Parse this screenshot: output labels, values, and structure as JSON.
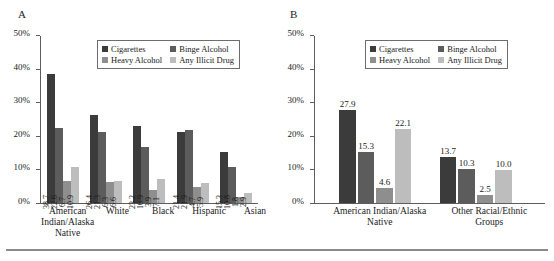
{
  "figure": {
    "panels": [
      {
        "letter": "A",
        "name": "panel-a",
        "axis": {
          "ylabel": "",
          "xlabel": "",
          "ticks": [
            "0%",
            "10%",
            "20%",
            "30%",
            "40%",
            "50%"
          ],
          "ymin": 0,
          "ymax": 50
        },
        "legend": [
          {
            "label": "Cigarettes",
            "color": "#3b3b3b"
          },
          {
            "label": "Binge Alcohol",
            "color": "#5c5c5c"
          },
          {
            "label": "Heavy Alcohol",
            "color": "#8e8e8e"
          },
          {
            "label": "Any Illicit Drug",
            "color": "#bdbdbd"
          }
        ],
        "groups": [
          {
            "label": "American Indian/Alaska Native",
            "bars": [
              {
                "series": "Cigarettes",
                "value": 38.7,
                "label": "38.7"
              },
              {
                "series": "Binge Alcohol",
                "value": 22.6,
                "label": "22.6"
              },
              {
                "series": "Heavy Alcohol",
                "value": 6.7,
                "label": "6.7"
              },
              {
                "series": "Any Illicit Drug",
                "value": 10.9,
                "label": "10.9"
              }
            ]
          },
          {
            "label": "White",
            "bars": [
              {
                "series": "Cigarettes",
                "value": 26.4,
                "label": "26.4"
              },
              {
                "series": "Binge Alcohol",
                "value": 21.3,
                "label": "21.3"
              },
              {
                "series": "Heavy Alcohol",
                "value": 6.3,
                "label": "6.3"
              },
              {
                "series": "Any Illicit Drug",
                "value": 6.6,
                "label": "6.6"
              }
            ]
          },
          {
            "label": "Black",
            "bars": [
              {
                "series": "Cigarettes",
                "value": 23.2,
                "label": "23.2"
              },
              {
                "series": "Binge Alcohol",
                "value": 16.9,
                "label": "16.9"
              },
              {
                "series": "Heavy Alcohol",
                "value": 3.9,
                "label": "3.9"
              },
              {
                "series": "Any Illicit Drug",
                "value": 7.1,
                "label": "7.1"
              }
            ]
          },
          {
            "label": "Hispanic",
            "bars": [
              {
                "series": "Cigarettes",
                "value": 21.4,
                "label": "21.4"
              },
              {
                "series": "Binge Alcohol",
                "value": 21.9,
                "label": "21.9"
              },
              {
                "series": "Heavy Alcohol",
                "value": 4.7,
                "label": "4.7"
              },
              {
                "series": "Any Illicit Drug",
                "value": 5.9,
                "label": "5.9"
              }
            ]
          },
          {
            "label": "Asian",
            "bars": [
              {
                "series": "Cigarettes",
                "value": 15.3,
                "label": "15.3"
              },
              {
                "series": "Binge Alcohol",
                "value": 10.8,
                "label": "10.8"
              },
              {
                "series": "Heavy Alcohol",
                "value": 1.8,
                "label": "1.8"
              },
              {
                "series": "Any Illicit Drug",
                "value": 2.9,
                "label": "2.9"
              }
            ]
          }
        ]
      },
      {
        "letter": "B",
        "name": "panel-b",
        "axis": {
          "ylabel": "",
          "xlabel": "",
          "ticks": [
            "0%",
            "10%",
            "20%",
            "30%",
            "40%",
            "50%"
          ],
          "ymin": 0,
          "ymax": 50
        },
        "legend": [
          {
            "label": "Cigarettes",
            "color": "#3b3b3b"
          },
          {
            "label": "Binge Alcohol",
            "color": "#5c5c5c"
          },
          {
            "label": "Heavy Alcohol",
            "color": "#8e8e8e"
          },
          {
            "label": "Any Illicit Drug",
            "color": "#bdbdbd"
          }
        ],
        "groups": [
          {
            "label": "American Indian/Alaska Native",
            "bars": [
              {
                "series": "Cigarettes",
                "value": 27.9,
                "label": "27.9"
              },
              {
                "series": "Binge Alcohol",
                "value": 15.3,
                "label": "15.3"
              },
              {
                "series": "Heavy Alcohol",
                "value": 4.6,
                "label": "4.6"
              },
              {
                "series": "Any Illicit Drug",
                "value": 22.1,
                "label": "22.1"
              }
            ]
          },
          {
            "label": "Other Racial/Ethnic Groups",
            "bars": [
              {
                "series": "Cigarettes",
                "value": 13.7,
                "label": "13.7"
              },
              {
                "series": "Binge Alcohol",
                "value": 10.3,
                "label": "10.3"
              },
              {
                "series": "Heavy Alcohol",
                "value": 2.5,
                "label": "2.5"
              },
              {
                "series": "Any Illicit Drug",
                "value": 10.0,
                "label": "10.0"
              }
            ]
          }
        ]
      }
    ]
  },
  "chart_data": [
    {
      "type": "bar",
      "title": "A",
      "xlabel": "",
      "ylabel": "",
      "ylim": [
        0,
        50
      ],
      "yticks": [
        0,
        10,
        20,
        30,
        40,
        50
      ],
      "ytick_labels": [
        "0%",
        "10%",
        "20%",
        "30%",
        "40%",
        "50%"
      ],
      "grid": false,
      "legend_position": "upper-center-inside",
      "categories": [
        "American Indian/Alaska Native",
        "White",
        "Black",
        "Hispanic",
        "Asian"
      ],
      "series": [
        {
          "name": "Cigarettes",
          "color": "#3b3b3b",
          "values": [
            38.7,
            26.4,
            23.2,
            21.4,
            15.3
          ]
        },
        {
          "name": "Binge Alcohol",
          "color": "#5c5c5c",
          "values": [
            22.6,
            21.3,
            16.9,
            21.9,
            10.8
          ]
        },
        {
          "name": "Heavy Alcohol",
          "color": "#8e8e8e",
          "values": [
            6.7,
            6.3,
            3.9,
            4.7,
            1.8
          ]
        },
        {
          "name": "Any Illicit Drug",
          "color": "#bdbdbd",
          "values": [
            10.9,
            6.6,
            7.1,
            5.9,
            2.9
          ]
        }
      ]
    },
    {
      "type": "bar",
      "title": "B",
      "xlabel": "",
      "ylabel": "",
      "ylim": [
        0,
        50
      ],
      "yticks": [
        0,
        10,
        20,
        30,
        40,
        50
      ],
      "ytick_labels": [
        "0%",
        "10%",
        "20%",
        "30%",
        "40%",
        "50%"
      ],
      "grid": false,
      "legend_position": "upper-center-inside",
      "categories": [
        "American Indian/Alaska Native",
        "Other Racial/Ethnic Groups"
      ],
      "series": [
        {
          "name": "Cigarettes",
          "color": "#3b3b3b",
          "values": [
            27.9,
            13.7
          ]
        },
        {
          "name": "Binge Alcohol",
          "color": "#5c5c5c",
          "values": [
            15.3,
            10.3
          ]
        },
        {
          "name": "Heavy Alcohol",
          "color": "#8e8e8e",
          "values": [
            4.6,
            2.5
          ]
        },
        {
          "name": "Any Illicit Drug",
          "color": "#bdbdbd",
          "values": [
            22.1,
            10.0
          ]
        }
      ]
    }
  ]
}
